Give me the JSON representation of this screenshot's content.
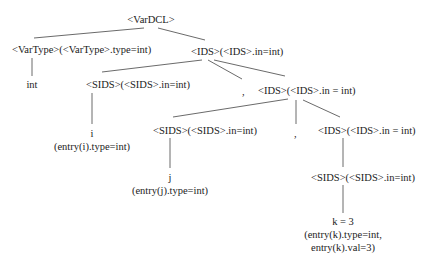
{
  "diagram": {
    "type": "annotated-parse-tree",
    "nodes": {
      "root": "<VarDCL>",
      "vartype": "<VarType>(<VarType>.type=int)",
      "ids1": "<IDS>(<IDS>.in=int)",
      "int_leaf": "int",
      "sids1": "<SIDS>(<SIDS>.in=int)",
      "comma1": ",",
      "ids2": "<IDS>(<IDS>.in = int)",
      "i_leaf": "i",
      "i_attr": "(entry(i).type=int)",
      "sids2": "<SIDS>(<SIDS>.in=int)",
      "comma2": ",",
      "ids3": "<IDS>(<IDS>.in = int)",
      "j_leaf": "j",
      "j_attr": "(entry(j).type=int)",
      "sids3": "<SIDS>(<SIDS>.in=int)",
      "k_leaf": "k = 3",
      "k_attr1": "(entry(k).type=int,",
      "k_attr2": "entry(k).val=3)"
    },
    "edges": [
      [
        "root",
        "vartype"
      ],
      [
        "root",
        "ids1"
      ],
      [
        "vartype",
        "int_leaf"
      ],
      [
        "ids1",
        "sids1"
      ],
      [
        "ids1",
        "comma1"
      ],
      [
        "ids1",
        "ids2"
      ],
      [
        "sids1",
        "i_leaf"
      ],
      [
        "ids2",
        "sids2"
      ],
      [
        "ids2",
        "comma2"
      ],
      [
        "ids2",
        "ids3"
      ],
      [
        "sids2",
        "j_leaf"
      ],
      [
        "ids3",
        "sids3"
      ],
      [
        "sids3",
        "k_leaf"
      ]
    ]
  }
}
